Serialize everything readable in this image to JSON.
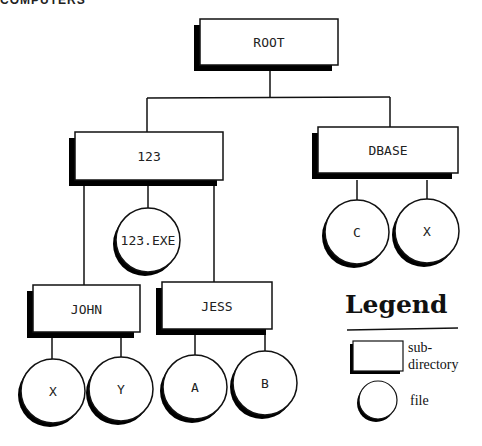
{
  "header": {
    "cut_text": "COMPUTERS"
  },
  "diagram": {
    "type": "directory-tree",
    "directories": [
      {
        "id": "root",
        "label": "ROOT",
        "x": 200,
        "y": 19,
        "w": 138,
        "h": 46
      },
      {
        "id": "d123",
        "label": "123",
        "x": 75,
        "y": 132,
        "w": 148,
        "h": 48
      },
      {
        "id": "dbase",
        "label": "DBASE",
        "x": 318,
        "y": 127,
        "w": 140,
        "h": 46
      },
      {
        "id": "john",
        "label": "JOHN",
        "x": 33,
        "y": 285,
        "w": 107,
        "h": 47
      },
      {
        "id": "jess",
        "label": "JESS",
        "x": 162,
        "y": 282,
        "w": 110,
        "h": 47
      }
    ],
    "files": [
      {
        "id": "exe",
        "label": "123.EXE",
        "parent": "d123",
        "cx": 148,
        "cy": 240,
        "r": 32
      },
      {
        "id": "c",
        "label": "C",
        "parent": "dbase",
        "cx": 357,
        "cy": 232,
        "r": 32
      },
      {
        "id": "x1",
        "label": "X",
        "parent": "dbase",
        "cx": 427,
        "cy": 231,
        "r": 32
      },
      {
        "id": "x2",
        "label": "X",
        "parent": "john",
        "cx": 53,
        "cy": 391,
        "r": 32
      },
      {
        "id": "y",
        "label": "Y",
        "parent": "john",
        "cx": 121,
        "cy": 389,
        "r": 32
      },
      {
        "id": "a",
        "label": "A",
        "parent": "jess",
        "cx": 195,
        "cy": 387,
        "r": 32
      },
      {
        "id": "b",
        "label": "B",
        "parent": "jess",
        "cx": 265,
        "cy": 383,
        "r": 32
      }
    ],
    "connectors": [
      {
        "from": "root",
        "points": [
          [
            270,
            71
          ],
          [
            270,
            98
          ]
        ]
      },
      {
        "from": "root",
        "points": [
          [
            147,
            98
          ],
          [
            390,
            97
          ]
        ]
      },
      {
        "from": "root",
        "to": "d123",
        "points": [
          [
            147,
            98
          ],
          [
            147,
            132
          ]
        ]
      },
      {
        "from": "root",
        "to": "dbase",
        "points": [
          [
            390,
            97
          ],
          [
            390,
            127
          ]
        ]
      },
      {
        "from": "d123",
        "to": "john",
        "points": [
          [
            84,
            186
          ],
          [
            84,
            285
          ]
        ]
      },
      {
        "from": "d123",
        "to": "exe",
        "points": [
          [
            148,
            186
          ],
          [
            148,
            208
          ]
        ]
      },
      {
        "from": "d123",
        "to": "jess",
        "points": [
          [
            214,
            186
          ],
          [
            214,
            282
          ]
        ]
      },
      {
        "from": "dbase",
        "to": "c",
        "points": [
          [
            357,
            180
          ],
          [
            357,
            200
          ]
        ]
      },
      {
        "from": "dbase",
        "to": "x1",
        "points": [
          [
            427,
            180
          ],
          [
            427,
            199
          ]
        ]
      },
      {
        "from": "john",
        "to": "x2",
        "points": [
          [
            52,
            338
          ],
          [
            52,
            359
          ]
        ]
      },
      {
        "from": "john",
        "to": "y",
        "points": [
          [
            121,
            338
          ],
          [
            121,
            357
          ]
        ]
      },
      {
        "from": "jess",
        "to": "a",
        "points": [
          [
            195,
            335
          ],
          [
            195,
            355
          ]
        ]
      },
      {
        "from": "jess",
        "to": "b",
        "points": [
          [
            265,
            335
          ],
          [
            265,
            351
          ]
        ]
      }
    ]
  },
  "legend": {
    "title": "Legend",
    "items": [
      {
        "symbol": "box",
        "label_line1": "sub-",
        "label_line2": "directory"
      },
      {
        "symbol": "circle",
        "label_line1": "file"
      }
    ]
  },
  "colors": {
    "ink": "#111111",
    "fill": "#ffffff",
    "shadow": "#000000"
  }
}
